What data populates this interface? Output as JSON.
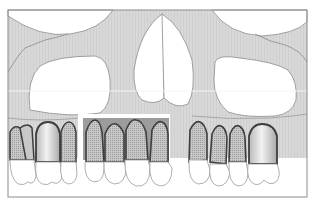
{
  "figure": {
    "type": "dental-anatomy-illustration",
    "colors": {
      "background": "#ffffff",
      "bone": "#d6d6d6",
      "bone_outline": "#8a8a8a",
      "frame": "#8c8c8c",
      "graft_region": "#9a9a9a",
      "root_fill": "#c4c4c4",
      "root_outline": "#3d3d3d",
      "crown_fill": "#ffffff",
      "crown_outline": "#9a9a9a",
      "periodontal_dots": "#6e6e6e",
      "white_line": "#f4f4f4"
    },
    "regions": {
      "orbits": 2,
      "nasal_cavity": 1,
      "maxillary_sinuses": 2,
      "graft_region_label": "anterior graft zone"
    },
    "teeth": {
      "left_posterior": 3,
      "anterior_highlighted": 4,
      "right_posterior": 4
    }
  }
}
